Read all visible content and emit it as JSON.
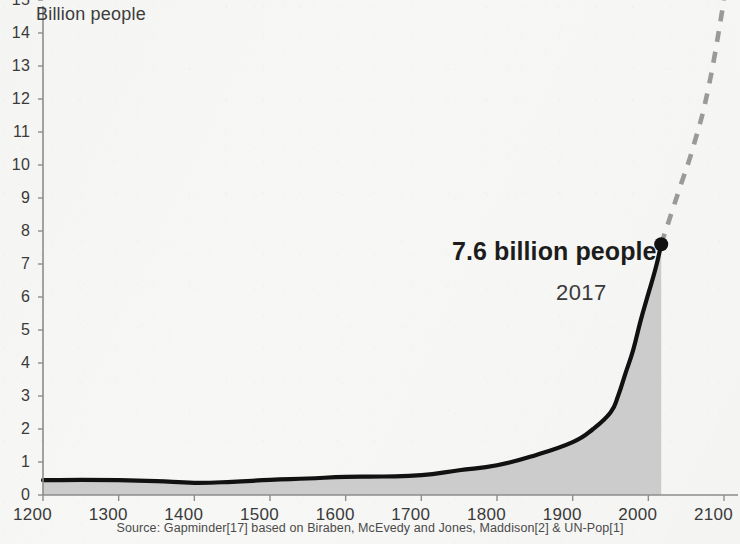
{
  "chart_data": {
    "type": "area",
    "title": "",
    "subtitle": "",
    "ylabel": "Billion people",
    "xlabel": "",
    "xlim": [
      1200,
      2100
    ],
    "ylim": [
      0,
      15
    ],
    "grid": false,
    "legend": "none",
    "x_ticks": [
      "1200",
      "1300",
      "1400",
      "1500",
      "1600",
      "1700",
      "1800",
      "1900",
      "2000",
      "2100"
    ],
    "y_ticks": [
      "0",
      "1",
      "2",
      "3",
      "4",
      "5",
      "6",
      "7",
      "8",
      "9",
      "10",
      "11",
      "12",
      "13",
      "14",
      "15"
    ],
    "series": [
      {
        "name": "World population (historical)",
        "style": "solid-line-with-area-fill",
        "line_color": "#111111",
        "fill_color": "#c9c9c9",
        "x": [
          1200,
          1250,
          1300,
          1350,
          1400,
          1450,
          1500,
          1550,
          1600,
          1650,
          1700,
          1750,
          1800,
          1850,
          1900,
          1927,
          1950,
          1960,
          1970,
          1980,
          1990,
          2000,
          2010,
          2017
        ],
        "values": [
          0.45,
          0.46,
          0.45,
          0.42,
          0.37,
          0.4,
          0.46,
          0.5,
          0.55,
          0.56,
          0.6,
          0.75,
          0.9,
          1.2,
          1.6,
          2.0,
          2.5,
          3.0,
          3.7,
          4.4,
          5.3,
          6.1,
          6.9,
          7.6
        ]
      },
      {
        "name": "Projection",
        "style": "dashed-line",
        "line_color": "#9a9a9a",
        "x": [
          2017,
          2040,
          2060,
          2080,
          2100
        ],
        "values": [
          7.6,
          9.2,
          10.6,
          12.4,
          15.0
        ]
      }
    ],
    "annotations": [
      {
        "name": "endpoint-marker",
        "label": "7.6 billion people",
        "sublabel": "2017",
        "x": 2017,
        "y": 7.6,
        "marker": "filled-dot"
      }
    ],
    "source": "Source: Gapminder[17] based on Biraben, McEvedy and Jones, Maddison[2] & UN-Pop[1]"
  },
  "axis": {
    "y_title": "Billion people"
  },
  "annotation": {
    "value_label": "7.6 billion people",
    "year_label": "2017"
  },
  "footer": {
    "source": "Source: Gapminder[17] based on Biraben, McEvedy and Jones, Maddison[2] & UN-Pop[1]"
  },
  "colors": {
    "line": "#111111",
    "fill": "#c9c9c9",
    "projection": "#9a9a9a",
    "axis": "#8d8d8d",
    "background": "#f7f7f5"
  }
}
